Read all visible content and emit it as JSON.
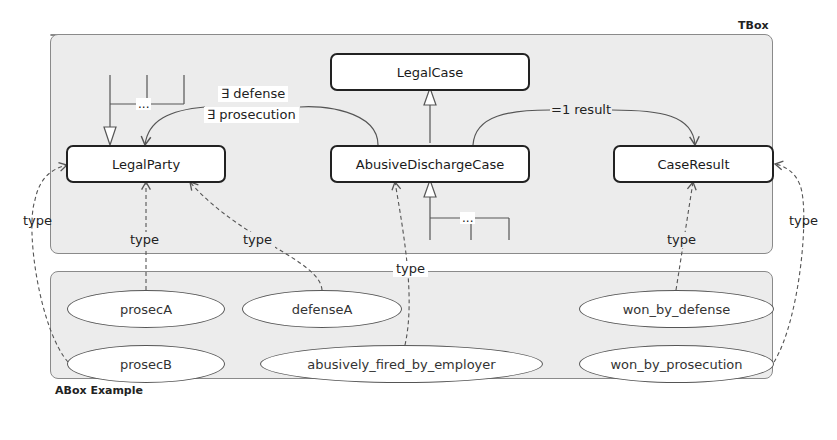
{
  "tbox": {
    "label": "TBox",
    "classes": {
      "legal_case": "LegalCase",
      "legal_party": "LegalParty",
      "abusive_discharge_case": "AbusiveDischargeCase",
      "case_result": "CaseResult"
    },
    "relations": {
      "defense_prosecution_line1": "∃ defense",
      "defense_prosecution_line2": "∃ prosecution",
      "result": "=1 result"
    },
    "ellipsis": "..."
  },
  "abox": {
    "label": "ABox Example",
    "individuals": {
      "prosecA": "prosecA",
      "defenseA": "defenseA",
      "prosecB": "prosecB",
      "abusively_fired": "abusively_fired_by_employer",
      "won_by_defense": "won_by_defense",
      "won_by_prosecution": "won_by_prosecution"
    }
  },
  "edge_labels": {
    "type": "type"
  },
  "colors": {
    "panel_bg": "#ececec",
    "panel_border": "#8a8a8a",
    "class_border": "#222222",
    "edge": "#555555"
  }
}
